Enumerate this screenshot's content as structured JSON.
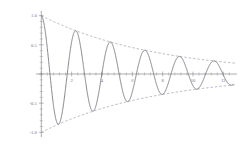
{
  "chart_data": {
    "type": "line",
    "title": "",
    "subtitle": "",
    "xlabel": "",
    "ylabel": "",
    "xlim": [
      -0.35,
      12.9
    ],
    "ylim": [
      -1.08,
      1.08
    ],
    "grid": false,
    "legend": null,
    "legend_position": "none",
    "background_color": "#ffffff",
    "x_ticks": [
      0,
      2,
      4,
      6,
      8,
      10,
      12
    ],
    "x_tick_labels": [
      "",
      "2",
      "4",
      "6",
      "8",
      "10",
      "12"
    ],
    "x_minor_tick_step": 0.4,
    "y_ticks": [
      -1.0,
      -0.5,
      0.0,
      0.5,
      1.0
    ],
    "y_tick_labels": [
      "-1.0",
      "-0.5",
      "",
      "0.5",
      "1.0"
    ],
    "y_minor_tick_step": 0.1,
    "axes": {
      "x_axis_at_y": 0,
      "y_axis_at_x": 0,
      "axis_color": "#8a8a8a"
    },
    "series": [
      {
        "name": "damped-oscillation",
        "role": "main-curve",
        "type": "line",
        "style": "solid",
        "color": "#6f6f78",
        "function": "exp(-t/7.6)*cos(2*pi*t/2.28)",
        "amplitude_initial": 1.0,
        "decay_constant": 7.6,
        "period": 2.28,
        "x_start": 0,
        "x_end": 12.65,
        "peaks": [
          {
            "x": 0.0,
            "y": 1.0
          },
          {
            "x": 2.28,
            "y": 0.741
          },
          {
            "x": 4.56,
            "y": 0.549
          },
          {
            "x": 6.84,
            "y": 0.407
          },
          {
            "x": 9.12,
            "y": 0.301
          },
          {
            "x": 11.4,
            "y": 0.223
          }
        ],
        "troughs": [
          {
            "x": 1.14,
            "y": -0.861
          },
          {
            "x": 3.42,
            "y": -0.638
          },
          {
            "x": 5.7,
            "y": -0.473
          },
          {
            "x": 7.98,
            "y": -0.35
          },
          {
            "x": 10.26,
            "y": -0.259
          },
          {
            "x": 12.54,
            "y": -0.192
          }
        ]
      },
      {
        "name": "upper-envelope",
        "role": "envelope",
        "type": "line",
        "style": "dashed",
        "color": "#9b9ba6",
        "function": "exp(-t/7.6)",
        "endpoints": [
          {
            "x": 0,
            "y": 1.0
          },
          {
            "x": 12.85,
            "y": 0.184
          }
        ]
      },
      {
        "name": "lower-envelope",
        "role": "envelope",
        "type": "line",
        "style": "dashed",
        "color": "#9b9ba6",
        "function": "-exp(-t/7.6)",
        "endpoints": [
          {
            "x": 0,
            "y": -1.0
          },
          {
            "x": 12.85,
            "y": -0.184
          }
        ]
      }
    ]
  }
}
